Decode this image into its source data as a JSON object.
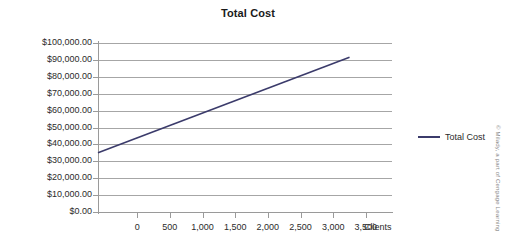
{
  "chart_data": {
    "type": "line",
    "title": "Total Cost",
    "xlabel": "Clients",
    "ylabel": "",
    "grid": true,
    "legend_position": "right",
    "xlim": [
      -600,
      3900
    ],
    "ylim": [
      0,
      100000
    ],
    "x_ticks": [
      0,
      500,
      1000,
      1500,
      2000,
      2500,
      3000,
      3500
    ],
    "x_tick_labels": [
      "0",
      "500",
      "1,000",
      "1,500",
      "2,000",
      "2,500",
      "3,000",
      "3,500"
    ],
    "y_ticks": [
      0,
      10000,
      20000,
      30000,
      40000,
      50000,
      60000,
      70000,
      80000,
      90000,
      100000
    ],
    "y_tick_labels": [
      "$0.00",
      "$10,000.00",
      "$20,000.00",
      "$30,000.00",
      "$40,000.00",
      "$50,000.00",
      "$60,000.00",
      "$70,000.00",
      "$80,000.00",
      "$90,000.00",
      "$100,000.00"
    ],
    "series": [
      {
        "name": "Total Cost",
        "color": "#3b3b6b",
        "x": [
          -600,
          3250
        ],
        "values": [
          35000,
          91500
        ]
      }
    ]
  },
  "legend": {
    "items": [
      {
        "label": "Total Cost",
        "color": "#3b3b6b"
      }
    ]
  },
  "credit": "© Milady, a part of Cengage Learning"
}
